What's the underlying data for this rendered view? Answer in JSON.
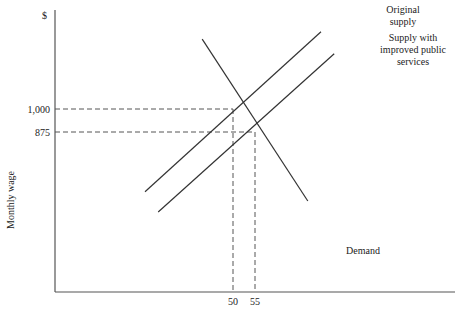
{
  "chart_data": {
    "type": "line",
    "title": "",
    "xlabel": "",
    "ylabel": "Monthly wage",
    "y_unit_label": "$",
    "x_ticks": [
      {
        "value": 50,
        "label": "50"
      },
      {
        "value": 55,
        "label": "55"
      }
    ],
    "y_ticks": [
      {
        "value": 1000,
        "label": "1,000"
      },
      {
        "value": 875,
        "label": "875"
      }
    ],
    "grid": false,
    "series": [
      {
        "name": "Original supply",
        "label_lines": [
          "Original",
          "supply"
        ],
        "points": [
          [
            30,
            550
          ],
          [
            70,
            1420
          ]
        ]
      },
      {
        "name": "Supply with improved public services",
        "label_lines": [
          "Supply with",
          "improved public",
          "services"
        ],
        "points": [
          [
            33,
            440
          ],
          [
            73,
            1300
          ]
        ]
      },
      {
        "name": "Demand",
        "label_lines": [
          "Demand"
        ],
        "points": [
          [
            43,
            1380
          ],
          [
            67,
            500
          ]
        ]
      }
    ],
    "equilibria": [
      {
        "name": "original",
        "x": 50,
        "y": 1000
      },
      {
        "name": "improved",
        "x": 55,
        "y": 875
      }
    ],
    "xlim": [
      18,
      76
    ],
    "ylim": [
      0,
      1650
    ]
  }
}
